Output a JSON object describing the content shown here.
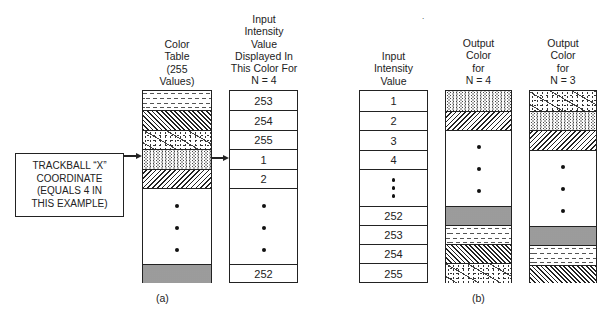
{
  "panel_a": {
    "label": "(a)",
    "color_table_header": "Color\nTable\n(255\nValues)",
    "input_header": "Input\nIntensity\nValue\nDisplayed In\nThis Color For\nN = 4",
    "trackball_box": "TRACKBALL “X”\nCOORDINATE\n(EQUALS 4 IN\nTHIS EXAMPLE)",
    "color_table_rows": [
      "dashed",
      "back-hatch",
      "confetti",
      "stipple",
      "forward-hatch",
      "ellipsis",
      "dense-grey"
    ],
    "input_values": [
      "253",
      "254",
      "255",
      "1",
      "2",
      "…",
      "252"
    ]
  },
  "panel_b": {
    "label": "(b)",
    "input_header": "Input\nIntensity\nValue",
    "n4_header": "Output\nColor\nfor\nN = 4",
    "n3_header": "Output\nColor\nfor\nN = 3",
    "input_values": [
      "1",
      "2",
      "3",
      "4",
      "⋮",
      "252",
      "253",
      "254",
      "255"
    ],
    "n4_rows": [
      "stipple",
      "forward-hatch",
      "ellipsis",
      "dense-grey",
      "dashed",
      "back-hatch",
      "confetti"
    ],
    "n3_rows": [
      "confetti",
      "stipple",
      "forward-hatch",
      "ellipsis",
      "dense-grey",
      "dashed",
      "back-hatch"
    ]
  },
  "stray_mark": "."
}
